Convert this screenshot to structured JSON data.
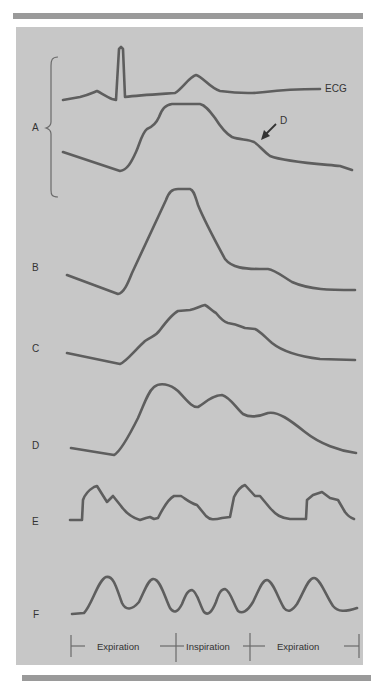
{
  "figure": {
    "panel_labels": {
      "A": "A",
      "B": "B",
      "C": "C",
      "D": "D",
      "E": "E",
      "F": "F"
    },
    "ecg_label": "ECG",
    "arrow_label": "D",
    "respiration_axis": {
      "phases": [
        "Expiration",
        "Inspiration",
        "Expiration"
      ]
    },
    "colors": {
      "background": "#c7c7c7",
      "trace": "#5e5e5e",
      "rule": "#9a9a9a",
      "page": "#ffffff"
    }
  },
  "traces": {
    "ecg": "M63,100 L80,97 C88,95 92,93 97,91 C101,93 107,97 112,99 L116,100 L119,49 L121,47 L123,49 L125,97 C140,95 160,94 175,93 C183,88 189,77 196,75 C203,77 210,88 220,91 C235,93 250,94 265,92 C280,90 300,89 320,89",
    "A": "M63,152 L120,171 C127,170 131,163 136,152 C140,143 142,133 147,129 C152,127 156,124 159,117 C162,109 165,105 172,104 L200,104 C205,105 209,110 215,118 C220,126 225,133 232,137 C240,140 248,139 254,142 C259,145 263,151 270,156 C285,162 320,164 340,166 L352,170",
    "B": "M67,275 L118,294 C124,293 128,283 132,273 L166,200 C169,192 172,189 178,189 L190,189 C194,190 195,196 198,205 C202,215 212,235 225,259 C232,268 245,269 260,269 L268,269 C275,270 282,276 292,282 C310,290 330,290 355,290",
    "C": "M67,353 L120,364 C126,362 135,350 145,341 C152,336 156,336 160,330 C166,322 172,314 178,311 L190,310 C196,309 200,306 205,305 C209,307 212,311 216,313 C220,318 224,322 228,323 C236,324 240,326 245,328 L255,329 C260,331 265,337 272,343 C282,351 295,356 320,359 L355,360",
    "D": "M71,448 L114,455 C120,452 128,438 138,418 C145,402 148,392 154,387 C160,382 170,384 178,391 C186,399 192,408 198,407 C205,403 212,395 222,395 C230,397 236,408 243,414 C250,418 258,417 268,413 C278,411 290,420 305,432 C320,444 340,451 356,453",
    "E": "M70,520 L82,520 L83,500 C85,494 89,490 94,487 L97,486 L107,502 L113,496 L121,506 C126,513 133,518 140,520 L146,518 L150,517 L154,519 L158,518 C163,508 168,499 174,496 L181,496 C186,499 190,503 197,505 L206,516 C210,520 214,520 222,518 L230,517 L234,497 C238,489 242,486 245,485 L255,496 L260,496 L270,508 C276,515 281,518 290,519 L306,519 L307,500 L313,495 L322,492 L330,498 L338,500 L345,512 C348,516 351,518 354,519",
    "F": "M72,614 L84,613 C92,605 98,580 106,577 C114,575 117,590 122,603 C126,611 132,610 139,602 C145,590 148,580 153,579 C160,578 165,598 170,608 C174,614 178,612 182,604 C186,594 188,590 192,590 C197,591 200,606 204,612 C208,616 212,612 216,602 C219,593 221,589 225,589 C230,590 234,605 238,611 C242,614 247,612 253,602 C259,590 262,580 267,580 C273,581 278,598 284,608 C288,613 292,611 297,604 C304,592 308,578 314,578 C320,578 326,596 333,606 C338,612 345,612 357,608"
  }
}
